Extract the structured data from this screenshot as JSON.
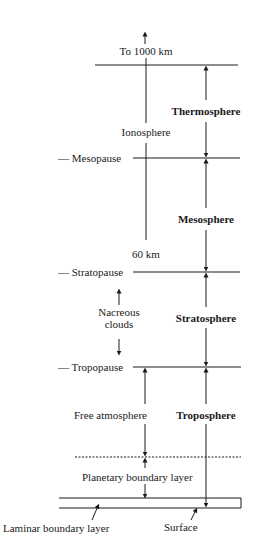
{
  "diagram": {
    "top_label": "To 1000 km",
    "ionosphere_label": "Ionosphere",
    "ionosphere_bottom_label": "60 km",
    "boundaries": [
      {
        "name": "Mesopause",
        "dash": "—"
      },
      {
        "name": "Stratopause",
        "dash": "—"
      },
      {
        "name": "Tropopause",
        "dash": "—"
      }
    ],
    "layers": [
      {
        "name": "Thermosphere"
      },
      {
        "name": "Mesosphere"
      },
      {
        "name": "Stratosphere"
      },
      {
        "name": "Troposphere"
      }
    ],
    "nacreous_clouds_line1": "Nacreous",
    "nacreous_clouds_line2": "clouds",
    "free_atmosphere_label": "Free atmosphere",
    "planetary_boundary_layer_label": "Planetary boundary layer",
    "laminar_boundary_layer_label": "Laminar boundary layer",
    "surface_label": "Surface",
    "colors": {
      "line": "#1a1a1a",
      "background": "#ffffff"
    }
  }
}
